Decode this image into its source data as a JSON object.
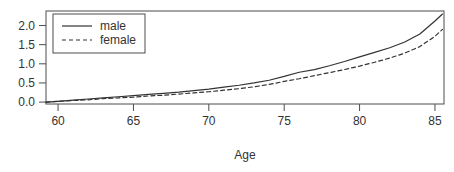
{
  "chart_data": {
    "type": "line",
    "title": "",
    "subtitle": "",
    "xlabel": "Age",
    "ylabel": "",
    "xlim": [
      59.2,
      85.6
    ],
    "ylim": [
      -0.05,
      2.38
    ],
    "xticks": [
      60,
      65,
      70,
      75,
      80,
      85
    ],
    "xtick_labels": [
      "60",
      "65",
      "70",
      "75",
      "80",
      "85"
    ],
    "yticks": [
      0.0,
      0.5,
      1.0,
      1.5,
      2.0
    ],
    "ytick_labels": [
      "0.0",
      "0.5",
      "1.0",
      "1.5",
      "2.0"
    ],
    "grid": false,
    "box": true,
    "legend": {
      "position": "top-left",
      "border": true,
      "entries": [
        {
          "name": "male",
          "label": "male",
          "linestyle": "solid",
          "color": "#333333"
        },
        {
          "name": "female",
          "label": "female",
          "linestyle": "dashed",
          "color": "#333333"
        }
      ]
    },
    "x": [
      59.2,
      60,
      61,
      62,
      63,
      64,
      65,
      66,
      67,
      68,
      69,
      70,
      71,
      72,
      73,
      74,
      75,
      76,
      77,
      78,
      79,
      80,
      81,
      82,
      83,
      84,
      85,
      85.5
    ],
    "series": [
      {
        "name": "male",
        "label": "male",
        "linestyle": "solid",
        "color": "#333333",
        "values": [
          0.0,
          0.02,
          0.05,
          0.08,
          0.11,
          0.14,
          0.17,
          0.2,
          0.23,
          0.26,
          0.3,
          0.34,
          0.39,
          0.44,
          0.5,
          0.57,
          0.67,
          0.78,
          0.85,
          0.95,
          1.06,
          1.18,
          1.3,
          1.42,
          1.57,
          1.78,
          2.12,
          2.3
        ]
      },
      {
        "name": "female",
        "label": "female",
        "linestyle": "dashed",
        "color": "#333333",
        "values": [
          0.0,
          0.02,
          0.04,
          0.06,
          0.09,
          0.11,
          0.13,
          0.16,
          0.18,
          0.21,
          0.24,
          0.27,
          0.31,
          0.35,
          0.4,
          0.46,
          0.54,
          0.61,
          0.69,
          0.77,
          0.85,
          0.94,
          1.04,
          1.15,
          1.28,
          1.45,
          1.72,
          1.9
        ]
      }
    ]
  }
}
